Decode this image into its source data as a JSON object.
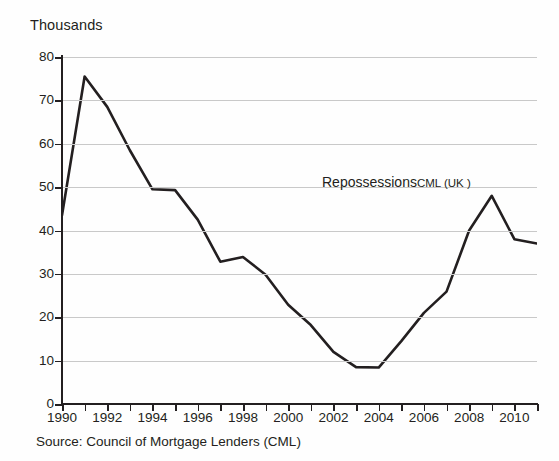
{
  "chart_data": {
    "type": "line",
    "title": "",
    "subtitle": "",
    "axis_title": "Thousands",
    "xlabel": "",
    "ylabel": "Thousands",
    "series_label_main": "Repossessions",
    "series_label_sub": "CML (UK )",
    "source_note": "Source: Council of Mortgage Lenders (CML)",
    "grid": true,
    "legend_position": "inline-annotation",
    "line_color": "#231f20",
    "grid_color": "#c9c9c9",
    "axis_color": "#231f20",
    "background_color": "#ffffff",
    "xlim": [
      1990,
      2011
    ],
    "ylim": [
      0,
      80
    ],
    "ytick_values": [
      0,
      10,
      20,
      30,
      40,
      50,
      60,
      70,
      80
    ],
    "ytick_labels": [
      "0",
      "10",
      "20",
      "30",
      "40",
      "50",
      "60",
      "70",
      "80"
    ],
    "xtick_values": [
      1990,
      1992,
      1994,
      1996,
      1998,
      2000,
      2002,
      2004,
      2006,
      2008,
      2010
    ],
    "xtick_labels": [
      "1990",
      "1992",
      "1994",
      "1996",
      "1998",
      "2000",
      "2002",
      "2004",
      "2006",
      "2008",
      "2010"
    ],
    "minor_xticks_every": 1,
    "x": [
      1990,
      1991,
      1992,
      1993,
      1994,
      1995,
      1996,
      1997,
      1998,
      1999,
      2000,
      2001,
      2002,
      2003,
      2004,
      2005,
      2006,
      2007,
      2008,
      2009,
      2010,
      2011
    ],
    "series": [
      {
        "name": "Repossessions CML (UK )",
        "values": [
          43.5,
          75.5,
          68.5,
          58.5,
          49.5,
          49.3,
          42.5,
          32.8,
          33.9,
          29.8,
          22.9,
          18.2,
          12.0,
          8.5,
          8.4,
          14.5,
          21.0,
          25.9,
          40.0,
          48.0,
          38.0,
          37.0
        ]
      }
    ]
  }
}
